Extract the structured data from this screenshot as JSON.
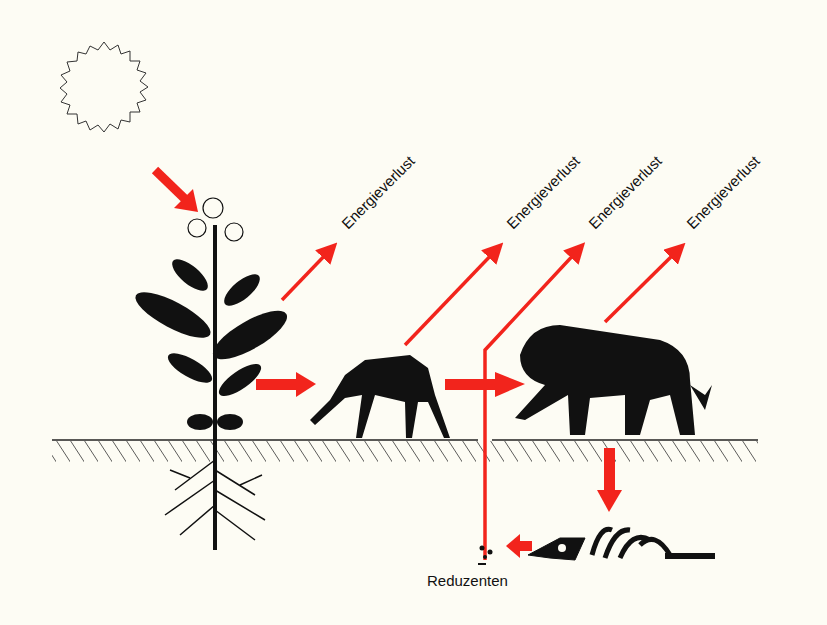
{
  "diagram": {
    "type": "energy-flow / food chain",
    "colors": {
      "arrow": "#f2241c",
      "silhouette": "#111111",
      "background": "#fdfcf4"
    },
    "nodes": [
      {
        "id": "sun",
        "label": ""
      },
      {
        "id": "plant",
        "label": ""
      },
      {
        "id": "deer",
        "label": ""
      },
      {
        "id": "lion",
        "label": ""
      },
      {
        "id": "carcass",
        "label": ""
      },
      {
        "id": "decomposers",
        "label": "Reduzenten"
      }
    ],
    "energy_loss_labels": [
      "Energieverlust",
      "Energieverlust",
      "Energieverlust",
      "Energieverlust"
    ],
    "reducers_label": "Reduzenten"
  }
}
